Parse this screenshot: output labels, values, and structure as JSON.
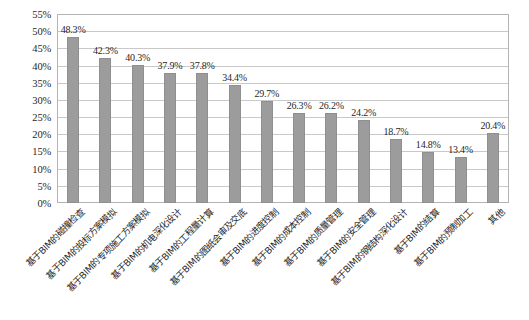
{
  "chart_data": {
    "type": "bar",
    "title": "",
    "xlabel": "",
    "ylabel": "",
    "ylim": [
      0,
      55
    ],
    "ytick_step": 5,
    "grid": true,
    "legend": false,
    "legend_position": "none",
    "bar_color": "#9c9c9c",
    "value_label_suffix": "%",
    "ytick_labels": [
      "0%",
      "5%",
      "10%",
      "15%",
      "20%",
      "25%",
      "30%",
      "35%",
      "40%",
      "45%",
      "50%",
      "55%"
    ],
    "ytick_values": [
      0,
      5,
      10,
      15,
      20,
      25,
      30,
      35,
      40,
      45,
      50,
      55
    ],
    "categories": [
      "基于BIM的碰撞检查",
      "基于BIM的投标方案模拟",
      "基于BIM的专项施工方案模拟",
      "基于BIM的机电深化设计",
      "基于BIM的工程量计算",
      "基于BIM的图纸会审及交底",
      "基于BIM的进度控制",
      "基于BIM的成本控制",
      "基于BIM的质量管理",
      "基于BIM的安全管理",
      "基于BIM的钢结构深化设计",
      "基于BIM的结算",
      "基于BIM的预制加工",
      "其他"
    ],
    "values": [
      48.3,
      42.3,
      40.3,
      37.9,
      37.8,
      34.4,
      29.7,
      26.3,
      26.2,
      24.2,
      18.7,
      14.8,
      13.4,
      20.4
    ],
    "value_labels": [
      "48.3%",
      "42.3%",
      "40.3%",
      "37.9%",
      "37.8%",
      "34.4%",
      "29.7%",
      "26.3%",
      "26.2%",
      "24.2%",
      "18.7%",
      "14.8%",
      "13.4%",
      "20.4%"
    ]
  }
}
